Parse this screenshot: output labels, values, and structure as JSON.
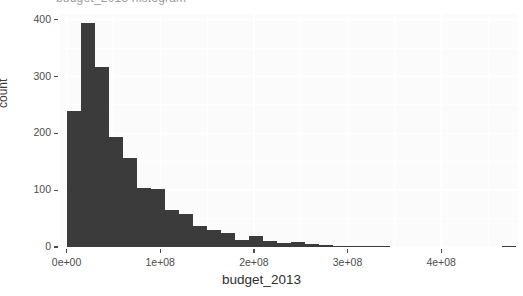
{
  "figure": {
    "width": 523,
    "height": 296,
    "background": "#ffffff",
    "panel_background": "#fbfbfb",
    "gridline_color": "#ffffff",
    "bar_fill": "#3b3b3b",
    "axis_text_color": "#4d4d4d",
    "clipped_title": "budget_2013 histogram"
  },
  "axes": {
    "y_ticks": [
      "0",
      "100",
      "200",
      "300",
      "400"
    ],
    "x_ticks": [
      "0e+00",
      "1e+08",
      "2e+08",
      "3e+08",
      "4e+08"
    ],
    "y_label": "count",
    "x_label": "budget_2013"
  },
  "chart_data": {
    "type": "bar",
    "title": "budget_2013 histogram",
    "xlabel": "budget_2013",
    "ylabel": "count",
    "xlim": [
      -7000000,
      482000000
    ],
    "ylim": [
      0,
      410
    ],
    "grid": true,
    "legend": "none",
    "bin_width": 15000000,
    "x_tick_values": [
      0,
      100000000,
      200000000,
      300000000,
      400000000
    ],
    "x_tick_labels": [
      "0e+00",
      "1e+08",
      "2e+08",
      "3e+08",
      "4e+08"
    ],
    "y_tick_values": [
      0,
      100,
      200,
      300,
      400
    ],
    "y_tick_labels": [
      "0",
      "100",
      "200",
      "300",
      "400"
    ],
    "bin_starts": [
      0,
      15000000,
      30000000,
      45000000,
      60000000,
      75000000,
      90000000,
      105000000,
      120000000,
      135000000,
      150000000,
      165000000,
      180000000,
      195000000,
      210000000,
      225000000,
      240000000,
      255000000,
      270000000,
      285000000,
      300000000,
      315000000,
      330000000,
      345000000,
      360000000,
      375000000,
      390000000,
      405000000,
      420000000,
      435000000,
      450000000,
      465000000
    ],
    "values": [
      240,
      395,
      317,
      194,
      157,
      104,
      102,
      65,
      58,
      37,
      30,
      24,
      12,
      20,
      10,
      7,
      8,
      5,
      4,
      2,
      1,
      1,
      1,
      0,
      0,
      0,
      0,
      0,
      0,
      0,
      0,
      2
    ]
  }
}
